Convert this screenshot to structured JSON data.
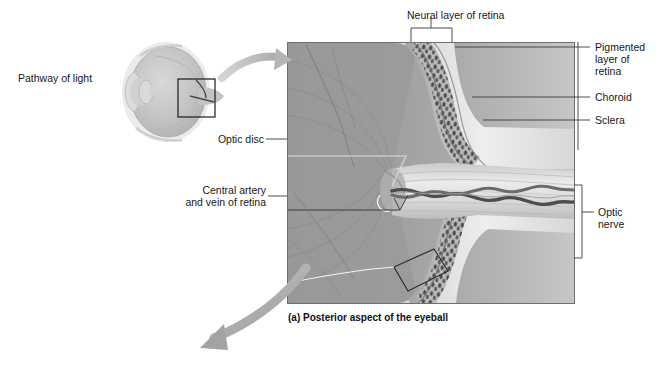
{
  "figure": {
    "caption": "(a) Posterior aspect of the eyeball",
    "type": "anatomical-illustration"
  },
  "overview": {
    "pathway_label": "Pathway of light",
    "inset_box_note": "magnified region"
  },
  "labels": {
    "neural_layer": "Neural layer of retina",
    "pigmented_layer": "Pigmented\nlayer of\nretina",
    "choroid": "Choroid",
    "sclera": "Sclera",
    "optic_nerve": "Optic\nnerve",
    "optic_disc": "Optic disc",
    "central_vessels": "Central artery\nand vein of retina"
  },
  "colors": {
    "text": "#171717",
    "leader": "#3a3a3a",
    "arrow": "#b9b9b9",
    "frame": "#6f6f6f",
    "background": "#ffffff",
    "eye_fill": "#c8c8c8",
    "tissue_light": "#e2e2e2",
    "tissue_mid": "#b4b4b4",
    "tissue_dark": "#8d8d8d",
    "vessel": "#555555"
  }
}
